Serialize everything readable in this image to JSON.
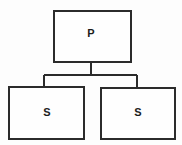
{
  "diagram": {
    "type": "tree-diagram",
    "colors": {
      "stroke": "#2b2b2b",
      "box_fill": "#fefefe",
      "background": "#fdfdfd",
      "label": "#1c1c1c"
    },
    "nodes": [
      {
        "id": "parent",
        "label": "P",
        "role": "parent",
        "x": 54,
        "y": 11,
        "width": 77,
        "height": 51,
        "label_x": 91,
        "label_y": 34
      },
      {
        "id": "child-left",
        "label": "S",
        "role": "child",
        "x": 9,
        "y": 87,
        "width": 75,
        "height": 52,
        "label_x": 47,
        "label_y": 113
      },
      {
        "id": "child-right",
        "label": "S",
        "role": "child",
        "x": 101,
        "y": 88,
        "width": 74,
        "height": 51,
        "label_x": 138,
        "label_y": 113
      }
    ],
    "connectors": [
      {
        "id": "parent-stem",
        "from": "parent",
        "to": "bus",
        "path": "M 91 62 L 91 75"
      },
      {
        "id": "bus-bar",
        "from": "bus",
        "to": "children",
        "path": "M 44 75 L 137 75"
      },
      {
        "id": "bus-to-child-left",
        "from": "bus",
        "to": "child-left",
        "path": "M 44 75 L 44 87"
      },
      {
        "id": "bus-to-child-right",
        "from": "bus",
        "to": "child-right",
        "path": "M 137 75 L 137 88"
      }
    ]
  }
}
